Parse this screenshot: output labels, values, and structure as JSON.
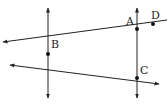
{
  "diagram": {
    "type": "geometry",
    "colors": {
      "line": "#222222",
      "point": "#111111",
      "background": "#ffffff"
    },
    "points": [
      {
        "name": "B",
        "x": 48,
        "y": 54,
        "label_dx": 3,
        "label_dy": -6
      },
      {
        "name": "A",
        "x": 137,
        "y": 29,
        "label_dx": -11,
        "label_dy": -4
      },
      {
        "name": "D",
        "x": 153,
        "y": 24,
        "label_dx": -2,
        "label_dy": -5
      },
      {
        "name": "C",
        "x": 137,
        "y": 78,
        "label_dx": 3,
        "label_dy": -4
      }
    ],
    "lines": [
      {
        "id": "vertical-line-through-B",
        "x1": 48,
        "y1": 8,
        "x2": 48,
        "y2": 98,
        "arrow_start": true,
        "arrow_end": true
      },
      {
        "id": "vertical-line-through-A-C",
        "x1": 137,
        "y1": 8,
        "x2": 137,
        "y2": 98,
        "arrow_start": true,
        "arrow_end": true
      },
      {
        "id": "line-B-A-D",
        "x1": 3,
        "y1": 42,
        "x2": 167,
        "y2": 20,
        "arrow_start": true,
        "arrow_end": false
      },
      {
        "id": "line-B-C",
        "x1": 10,
        "y1": 65,
        "x2": 159,
        "y2": 84,
        "arrow_start": true,
        "arrow_end": true
      }
    ]
  }
}
